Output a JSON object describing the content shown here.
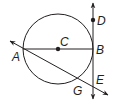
{
  "diagram": {
    "title": "",
    "colors": {
      "stroke": "#231f20",
      "background": "#ffffff"
    },
    "circle": {
      "center_label": "C",
      "cx": 58,
      "cy": 49,
      "r": 35
    },
    "points": [
      {
        "id": "A",
        "label": "A",
        "x": 23,
        "y": 49,
        "lx": 12,
        "ly": 61,
        "dot": false
      },
      {
        "id": "B",
        "label": "B",
        "x": 93,
        "y": 49,
        "lx": 96,
        "ly": 54,
        "dot": false
      },
      {
        "id": "C",
        "label": "C",
        "x": 58,
        "y": 49,
        "lx": 60,
        "ly": 46,
        "dot": true
      },
      {
        "id": "D",
        "label": "D",
        "x": 93,
        "y": 20,
        "lx": 97,
        "ly": 25,
        "dot": true
      },
      {
        "id": "E",
        "label": "E",
        "x": 93,
        "y": 85,
        "lx": 96,
        "ly": 84,
        "dot": false
      },
      {
        "id": "G",
        "label": "G",
        "x": 77,
        "y": 79,
        "lx": 73,
        "ly": 95,
        "dot": false
      }
    ],
    "segments": [
      {
        "name": "diameter-AB",
        "from": "A",
        "to": "B"
      }
    ],
    "lines": [
      {
        "name": "tangent-line-DE",
        "x1": 93,
        "y1": 3,
        "x2": 93,
        "y2": 99,
        "arrows": "both"
      },
      {
        "name": "secant-line-AG",
        "x1": 10,
        "y1": 41,
        "x2": 108,
        "y2": 95,
        "arrows": "both"
      }
    ]
  }
}
